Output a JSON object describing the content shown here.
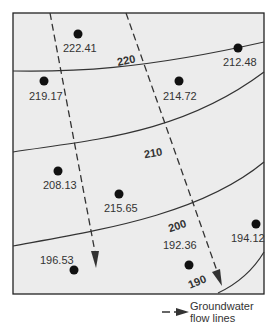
{
  "diagram": {
    "title": "",
    "background": "#ececec",
    "frame_color": "#222222",
    "contours": [
      {
        "label": "220",
        "value": 220
      },
      {
        "label": "210",
        "value": 210
      },
      {
        "label": "200",
        "value": 200
      },
      {
        "label": "190",
        "value": 190
      }
    ],
    "wells": [
      {
        "label": "222.41",
        "value": 222.41
      },
      {
        "label": "212.48",
        "value": 212.48
      },
      {
        "label": "219.17",
        "value": 219.17
      },
      {
        "label": "214.72",
        "value": 214.72
      },
      {
        "label": "208.13",
        "value": 208.13
      },
      {
        "label": "215.65",
        "value": 215.65
      },
      {
        "label": "194.12",
        "value": 194.12
      },
      {
        "label": "192.36",
        "value": 192.36
      },
      {
        "label": "196.53",
        "value": 196.53
      }
    ],
    "flow_lines": [
      {
        "name": "flow-line-west"
      },
      {
        "name": "flow-line-east"
      }
    ]
  },
  "legend": {
    "line1": "Groundwater",
    "line2": "flow lines"
  }
}
